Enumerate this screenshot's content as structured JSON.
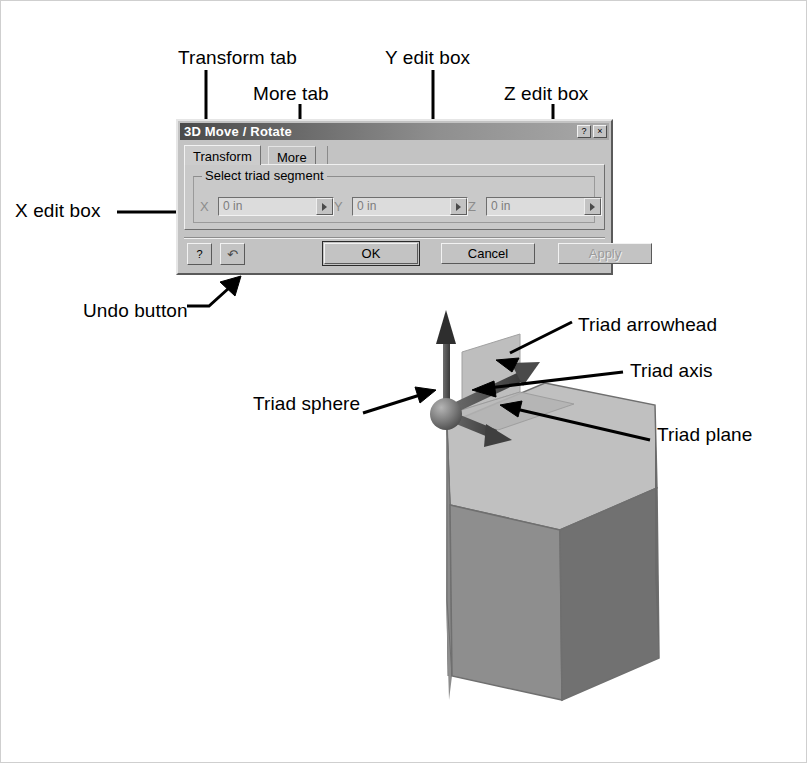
{
  "dialog": {
    "title": "3D Move / Rotate",
    "title_buttons": [
      {
        "name": "help-button",
        "glyph": "?"
      },
      {
        "name": "close-button",
        "glyph": "×"
      }
    ],
    "tabs": [
      {
        "label": "Transform",
        "active": true
      },
      {
        "label": "More",
        "active": false
      }
    ],
    "group": {
      "title": "Select triad segment",
      "fields": [
        {
          "label": "X",
          "value": "0 in",
          "spinner": "right-arrow"
        },
        {
          "label": "Y",
          "value": "0 in",
          "spinner": "right-arrow"
        },
        {
          "label": "Z",
          "value": "0 in",
          "spinner": "right-arrow"
        }
      ]
    },
    "buttons": {
      "help": "?",
      "undo": "↶",
      "ok": "OK",
      "cancel": "Cancel",
      "apply": "Apply",
      "apply_disabled": true
    }
  },
  "callouts": [
    {
      "id": "transform-tab",
      "label": "Transform tab",
      "x": 178,
      "y": 47
    },
    {
      "id": "more-tab",
      "label": "More tab",
      "x": 253,
      "y": 83
    },
    {
      "id": "y-edit-box",
      "label": "Y edit box",
      "x": 385,
      "y": 47
    },
    {
      "id": "z-edit-box",
      "label": "Z edit box",
      "x": 504,
      "y": 83
    },
    {
      "id": "x-edit-box",
      "label": "X edit box",
      "x": 15,
      "y": 200
    },
    {
      "id": "undo-button",
      "label": "Undo button",
      "x": 83,
      "y": 300
    },
    {
      "id": "triad-arrowhead",
      "label": "Triad arrowhead",
      "x": 578,
      "y": 314
    },
    {
      "id": "triad-axis",
      "label": "Triad axis",
      "x": 630,
      "y": 360
    },
    {
      "id": "triad-sphere",
      "label": "Triad sphere",
      "x": 253,
      "y": 393
    },
    {
      "id": "triad-plane",
      "label": "Triad plane",
      "x": 657,
      "y": 424
    }
  ],
  "colors": {
    "dialog_face": "#c3c3c3",
    "titlebar_dark": "#4a4a4a",
    "titlebar_light": "#a8a8a8",
    "field_bg": "#dcdcdc",
    "disabled_text": "#9b9b9b",
    "prism_front": "#8a8a8a",
    "prism_side": "#707070",
    "prism_top": "#bdbdbd",
    "triad_plane": "#b4b4b4",
    "callout_text": "#000000"
  },
  "model": {
    "shape": "hexagonal-prism",
    "triad_parts": [
      "sphere",
      "z-axis-arrow",
      "x-axis-arrow",
      "y-axis-arrow",
      "plane"
    ]
  }
}
